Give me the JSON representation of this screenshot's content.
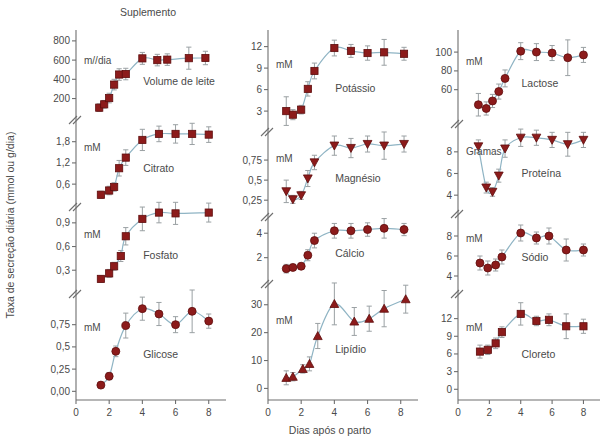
{
  "figure": {
    "title": "Suplemento",
    "ylabel": "Taxa de secreção diária (mmol ou g/dia)",
    "xlabel": "Dias após o parto",
    "marker_color": "#8C1B1B",
    "marker_edge_color": "#5E0D0D",
    "line_color": "#8FB4C4",
    "errorbar_color": "#9aa0a3",
    "axis_color": "#6e6e6e"
  },
  "chart_data": {
    "type": "scatter",
    "title": "Suplemento",
    "xlabel": "Dias após o parto",
    "ylabel": "Taxa de secreção diária (mmol ou g/dia)",
    "xlim": [
      0,
      8.8
    ],
    "xticks": [
      0,
      2,
      4,
      6,
      8
    ],
    "grid": false,
    "legend": "none",
    "panels": [
      {
        "name": "Volume de leite",
        "column": 1,
        "unit": "m//dia",
        "yticks": [
          200,
          400,
          600,
          800
        ],
        "ylim": [
          60,
          830
        ],
        "marker": "square",
        "x": [
          1.4,
          1.7,
          2.0,
          2.3,
          2.6,
          3.0,
          4.0,
          4.9,
          5.5,
          6.8,
          7.8
        ],
        "y": [
          105,
          140,
          205,
          345,
          450,
          455,
          618,
          600,
          605,
          620,
          622
        ],
        "yerr": [
          40,
          40,
          50,
          55,
          60,
          60,
          62,
          60,
          60,
          115,
          70
        ]
      },
      {
        "name": "Citrato",
        "column": 1,
        "unit": "mM",
        "yticks": [
          0.6,
          1.2,
          1.8
        ],
        "ylim": [
          0.18,
          2.3
        ],
        "marker": "square",
        "x": [
          1.5,
          2.0,
          2.3,
          2.6,
          3.0,
          4.0,
          5.0,
          6.0,
          7.0,
          8.0
        ],
        "y": [
          0.3,
          0.42,
          0.52,
          1.05,
          1.35,
          1.85,
          2.02,
          2.02,
          2.02,
          2.0
        ],
        "yerr": [
          0.1,
          0.12,
          0.12,
          0.22,
          0.22,
          0.3,
          0.22,
          0.26,
          0.3,
          0.22
        ]
      },
      {
        "name": "Fosfato",
        "column": 1,
        "unit": "mM",
        "yticks": [
          0.3,
          0.6,
          0.9
        ],
        "ylim": [
          0.1,
          1.05
        ],
        "marker": "square",
        "x": [
          1.5,
          2.0,
          2.3,
          2.7,
          3.0,
          4.0,
          5.0,
          6.0,
          8.0
        ],
        "y": [
          0.19,
          0.26,
          0.35,
          0.48,
          0.73,
          0.95,
          1.03,
          1.02,
          1.03
        ],
        "yerr": [
          0.04,
          0.05,
          0.05,
          0.07,
          0.11,
          0.15,
          0.13,
          0.14,
          0.12
        ]
      },
      {
        "name": "Glicose",
        "column": 1,
        "unit": "mM",
        "yticks": [
          0.0,
          0.25,
          0.5,
          0.75
        ],
        "ylim": [
          -0.03,
          1.05
        ],
        "marker": "circle",
        "x": [
          1.5,
          2.0,
          2.4,
          3.0,
          4.0,
          5.0,
          6.0,
          7.0,
          8.0
        ],
        "y": [
          0.07,
          0.17,
          0.45,
          0.74,
          0.93,
          0.87,
          0.75,
          0.9,
          0.79
        ],
        "yerr": [
          0.03,
          0.04,
          0.06,
          0.14,
          0.13,
          0.13,
          0.09,
          0.24,
          0.08
        ]
      },
      {
        "name": "Potássio",
        "column": 2,
        "unit": "mM",
        "yticks": [
          3,
          6,
          9,
          12
        ],
        "ylim": [
          1.2,
          13.2
        ],
        "marker": "square",
        "x": [
          1.1,
          1.5,
          2.0,
          2.4,
          2.8,
          4.0,
          5.0,
          6.0,
          7.0,
          8.2
        ],
        "y": [
          3.0,
          2.5,
          3.2,
          6.1,
          8.6,
          11.8,
          11.4,
          11.1,
          11.2,
          11.0
        ],
        "yerr": [
          2.0,
          0.7,
          0.6,
          1.0,
          1.1,
          1.1,
          0.9,
          1.0,
          1.8,
          0.9
        ]
      },
      {
        "name": "Magnésio",
        "column": 2,
        "unit": "mM",
        "yticks": [
          0.25,
          0.5,
          0.75
        ],
        "ylim": [
          0.14,
          1.05
        ],
        "marker": "triangle-down",
        "x": [
          1.1,
          1.5,
          2.0,
          2.4,
          2.8,
          4.0,
          5.0,
          6.0,
          7.0,
          8.2
        ],
        "y": [
          0.36,
          0.26,
          0.31,
          0.52,
          0.72,
          0.93,
          0.9,
          0.95,
          0.93,
          0.95
        ],
        "yerr": [
          0.14,
          0.05,
          0.05,
          0.1,
          0.09,
          0.12,
          0.12,
          0.1,
          0.17,
          0.1
        ]
      },
      {
        "name": "Cálcio",
        "column": 2,
        "unit": "",
        "yticks": [
          2,
          4
        ],
        "ylim": [
          0.5,
          5.0
        ],
        "marker": "circle",
        "x": [
          1.1,
          1.5,
          2.0,
          2.4,
          2.8,
          4.0,
          5.0,
          6.0,
          7.0,
          8.2
        ],
        "y": [
          1.1,
          1.2,
          1.3,
          2.2,
          3.4,
          4.2,
          4.2,
          4.3,
          4.4,
          4.3
        ],
        "yerr": [
          0.35,
          0.25,
          0.25,
          0.45,
          0.6,
          0.6,
          0.6,
          0.55,
          0.8,
          0.5
        ]
      },
      {
        "name": "Lipídio",
        "column": 2,
        "unit": "mM",
        "yticks": [
          0,
          10,
          20,
          30
        ],
        "ylim": [
          -2,
          36
        ],
        "marker": "triangle-up",
        "x": [
          1.1,
          1.5,
          2.1,
          2.5,
          3.0,
          4.0,
          5.2,
          6.1,
          7.0,
          8.3
        ],
        "y": [
          3.8,
          4.2,
          7.0,
          8.8,
          18.8,
          30.3,
          24.0,
          25.0,
          28.6,
          32.0
        ],
        "yerr": [
          2.5,
          1.5,
          1.5,
          2.5,
          4.5,
          7.5,
          5.0,
          4.5,
          6.5,
          5.0
        ]
      },
      {
        "name": "Lactose",
        "column": 3,
        "unit": "mM",
        "yticks": [
          60,
          80,
          100
        ],
        "ylim": [
          32,
          115
        ],
        "marker": "circle",
        "x": [
          1.3,
          1.8,
          2.2,
          2.6,
          3.0,
          4.0,
          5.0,
          6.0,
          7.0,
          8.0
        ],
        "y": [
          44,
          40,
          48,
          58,
          72,
          101,
          100,
          99,
          94,
          97
        ],
        "yerr": [
          12,
          7,
          7,
          8,
          9,
          9,
          9,
          8,
          19,
          8
        ]
      },
      {
        "name": "Proteína",
        "column": 3,
        "unit": "Gramas",
        "yticks": [
          4,
          6,
          8
        ],
        "ylim": [
          3.0,
          10.2
        ],
        "marker": "triangle-down",
        "x": [
          1.3,
          1.8,
          2.2,
          2.6,
          3.0,
          4.0,
          5.0,
          6.0,
          7.0,
          8.0
        ],
        "y": [
          8.5,
          4.7,
          4.3,
          5.8,
          8.3,
          9.3,
          9.3,
          9.1,
          8.7,
          9.1
        ],
        "yerr": [
          0.6,
          0.5,
          0.4,
          0.6,
          0.8,
          0.8,
          0.7,
          0.7,
          1.1,
          0.7
        ]
      },
      {
        "name": "Sódio",
        "column": 3,
        "unit": "mM",
        "yticks": [
          4,
          6,
          8
        ],
        "ylim": [
          3.0,
          9.8
        ],
        "marker": "circle",
        "x": [
          1.4,
          1.9,
          2.4,
          2.8,
          4.0,
          5.0,
          5.8,
          6.9,
          8.0
        ],
        "y": [
          5.3,
          4.8,
          5.1,
          5.9,
          8.3,
          7.8,
          8.0,
          6.6,
          6.6
        ],
        "yerr": [
          0.7,
          0.7,
          0.6,
          0.7,
          0.8,
          0.6,
          0.8,
          1.1,
          0.6
        ]
      },
      {
        "name": "Cloreto",
        "column": 3,
        "unit": "mM",
        "yticks": [
          0,
          3,
          6,
          9,
          12
        ],
        "ylim": [
          -0.8,
          15.5
        ],
        "marker": "square",
        "x": [
          1.4,
          1.9,
          2.4,
          2.8,
          4.0,
          5.0,
          5.8,
          6.9,
          8.0
        ],
        "y": [
          6.4,
          6.7,
          7.8,
          9.7,
          12.8,
          11.6,
          11.8,
          10.7,
          10.7
        ],
        "yerr": [
          1.1,
          0.8,
          0.9,
          0.9,
          1.9,
          0.8,
          1.0,
          2.1,
          1.2
        ]
      }
    ]
  }
}
